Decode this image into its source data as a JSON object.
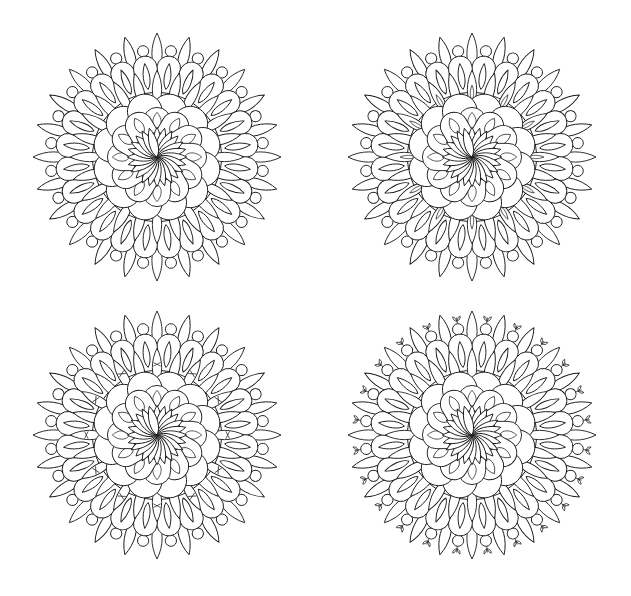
{
  "canvas": {
    "width": 631,
    "height": 596,
    "background": "#ffffff",
    "line_color": "#1a1a1a"
  },
  "mandalas": [
    {
      "id": "top-left",
      "cx": 157,
      "cy": 157,
      "radius": 124,
      "variant": "base"
    },
    {
      "id": "top-right",
      "cx": 472,
      "cy": 157,
      "radius": 124,
      "variant": "inner-leaves"
    },
    {
      "id": "bottom-left",
      "cx": 157,
      "cy": 435,
      "radius": 124,
      "variant": "inner-sprouts"
    },
    {
      "id": "bottom-right",
      "cx": 472,
      "cy": 435,
      "radius": 124,
      "variant": "outer-sprouts"
    }
  ],
  "structure": {
    "outer_leaves": 24,
    "outer_circles": 24,
    "u_petals": 24,
    "mid_leaves": 24,
    "scallop_ring_outer": 12,
    "scallop_ring_inner": 12,
    "center_petals": 24
  }
}
